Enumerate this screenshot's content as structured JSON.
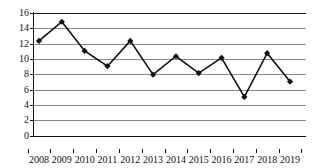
{
  "chart_data": {
    "type": "line",
    "title": "",
    "xlabel": "",
    "ylabel": "",
    "categories": [
      "2008",
      "2009",
      "2010",
      "2011",
      "2012",
      "2013",
      "2014",
      "2015",
      "2016",
      "2017",
      "2018",
      "2019"
    ],
    "values": [
      12.4,
      14.9,
      11.1,
      9.1,
      12.4,
      8.0,
      10.4,
      8.2,
      10.2,
      5.1,
      10.8,
      7.1
    ],
    "series": [
      {
        "name": "series-1",
        "values": [
          12.4,
          14.9,
          11.1,
          9.1,
          12.4,
          8.0,
          10.4,
          8.2,
          10.2,
          5.1,
          10.8,
          7.1
        ]
      }
    ],
    "ylim": [
      0,
      16
    ],
    "yticks": [
      0,
      2,
      4,
      6,
      8,
      10,
      12,
      14,
      16
    ],
    "ytick_labels": [
      "0",
      "2",
      "4",
      "6",
      "8",
      "10",
      "12",
      "14",
      "16"
    ],
    "grid": true,
    "grid_axis": "y",
    "legend": "none",
    "marker": "diamond",
    "line_color": "#111111",
    "marker_color": "#111111",
    "grid_color": "#8a8a8a",
    "axis_color": "#111111",
    "background_color": "#ffffff"
  }
}
